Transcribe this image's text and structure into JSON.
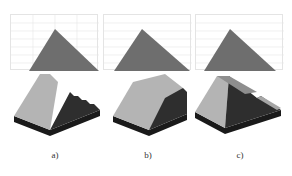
{
  "figure": {
    "panels": [
      {
        "id": "a",
        "label": "a)",
        "description": "stepped slope"
      },
      {
        "id": "b",
        "label": "b)",
        "description": "flat-topped slope"
      },
      {
        "id": "c",
        "label": "c)",
        "description": "ridge with side walls"
      }
    ],
    "colors": {
      "triangle": "#6e6e6e",
      "top_face": "#b4b4b4",
      "side_face": "#2e2e2e",
      "base": "#1a1a1a",
      "grid": "#e0e0e0"
    }
  }
}
